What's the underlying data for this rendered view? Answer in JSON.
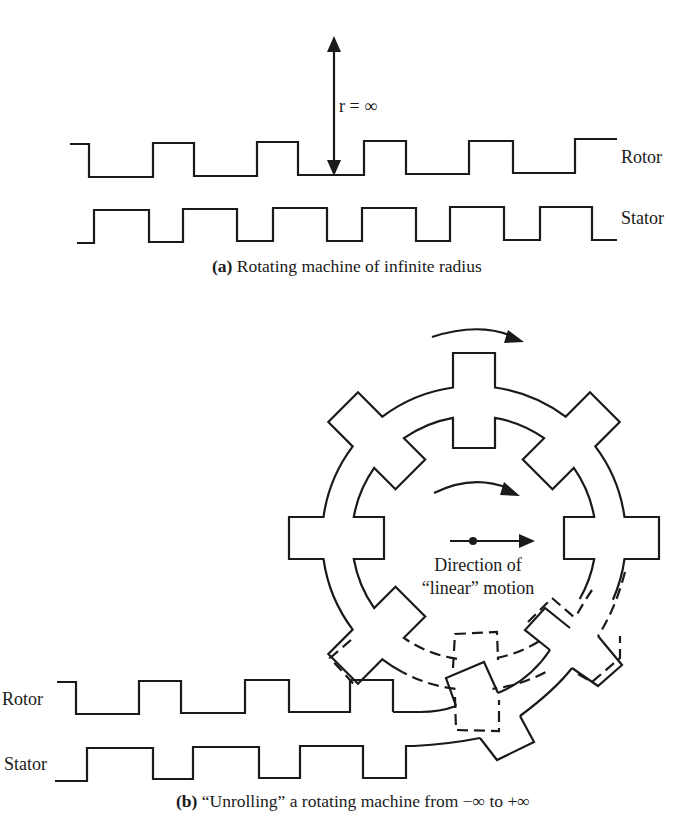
{
  "figure_a": {
    "distance_label": "r = ∞",
    "rotor_label": "Rotor",
    "stator_label": "Stator",
    "caption_prefix": "(a)",
    "caption_text": " Rotating machine of infinite radius"
  },
  "figure_b": {
    "rotor_label": "Rotor",
    "stator_label": "Stator",
    "motion_label_line1": "Direction of",
    "motion_label_line2": "“linear” motion",
    "caption_prefix": "(b)",
    "caption_text": " “Unrolling” a rotating machine from −∞ to +∞"
  },
  "geometry": {
    "gear_center": [
      474,
      538
    ],
    "outer_ring_radius": 152,
    "outer_tooth_radius": 185,
    "inner_ring_radius": 122,
    "inner_tooth_radius": 90,
    "tooth_half_width_px": 21,
    "tooth_count": 8
  },
  "colors": {
    "ink": "#1a1a1a",
    "background": "#ffffff"
  }
}
